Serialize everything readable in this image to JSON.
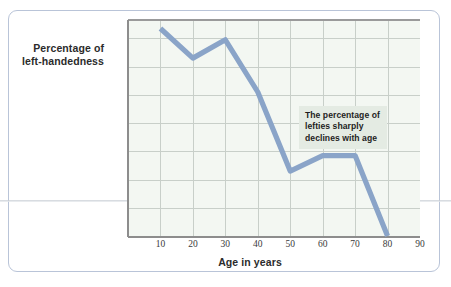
{
  "figure": {
    "frame_border_color": "#b9c4d8",
    "plot_background_color": "#f3f7f2",
    "gridline_color": "#c8cfc9",
    "line_color": "#8aa4c8",
    "annotation_background_color": "#e4ebe3"
  },
  "chart_data": {
    "type": "line",
    "title": "",
    "xlabel": "Age in years",
    "ylabel": "Percentage of left-handedness",
    "ylabel_lines": [
      "Percentage of",
      "left-handedness"
    ],
    "x": [
      10,
      20,
      30,
      40,
      50,
      60,
      70,
      80
    ],
    "values": [
      14.7,
      12.6,
      13.9,
      10.2,
      4.6,
      5.7,
      5.7,
      0.0
    ],
    "series": [
      {
        "name": "Percentage of left-handedness",
        "values": [
          14.7,
          12.6,
          13.9,
          10.2,
          4.6,
          5.7,
          5.7,
          0.0
        ]
      }
    ],
    "xlim": [
      0,
      90
    ],
    "ylim": [
      0,
      15.3
    ],
    "xticks": [
      10,
      20,
      30,
      40,
      50,
      60,
      70,
      80,
      90
    ],
    "xtick_labels": [
      "10",
      "20",
      "30",
      "40",
      "50",
      "60",
      "70",
      "80",
      "90"
    ],
    "yticks": [
      0,
      2,
      4,
      6,
      8,
      10,
      12,
      14
    ],
    "ytick_labels": [
      "0",
      "2",
      "4",
      "6",
      "8",
      "10",
      "12",
      "14%"
    ],
    "grid": true,
    "legend": false,
    "annotations": [
      {
        "text": "The percentage of lefties sharply declines with age",
        "lines": [
          "The percentage of",
          "lefties sharply",
          "declines with age"
        ],
        "x": 62,
        "y": 8.5
      }
    ]
  }
}
